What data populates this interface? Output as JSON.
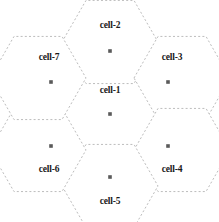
{
  "diagram": {
    "type": "hexagonal-cell-cluster",
    "background_color": "#ffffff",
    "border_color": "#bcbcbc",
    "dot_color": "#5a5a5a",
    "label_color": "#1a1a1a",
    "cells": [
      {
        "id": "cell-1",
        "label": "cell-1",
        "position": "center",
        "center_x": 110,
        "center_y": 114,
        "label_x": 110,
        "label_y": 91,
        "dot_x": 110,
        "dot_y": 114
      },
      {
        "id": "cell-2",
        "label": "cell-2",
        "position": "top",
        "center_x": 110,
        "center_y": 42,
        "label_x": 110,
        "label_y": 26,
        "dot_x": 110,
        "dot_y": 51
      },
      {
        "id": "cell-3",
        "label": "cell-3",
        "position": "upper-right",
        "center_x": 182,
        "center_y": 78,
        "label_x": 172,
        "label_y": 58,
        "dot_x": 168,
        "dot_y": 82
      },
      {
        "id": "cell-4",
        "label": "cell-4",
        "position": "lower-right",
        "center_x": 182,
        "center_y": 150,
        "label_x": 172,
        "label_y": 170,
        "dot_x": 168,
        "dot_y": 146
      },
      {
        "id": "cell-5",
        "label": "cell-5",
        "position": "bottom",
        "center_x": 110,
        "center_y": 186,
        "label_x": 110,
        "label_y": 202,
        "dot_x": 110,
        "dot_y": 177
      },
      {
        "id": "cell-6",
        "label": "cell-6",
        "position": "lower-left",
        "center_x": 38,
        "center_y": 150,
        "label_x": 49,
        "label_y": 170,
        "dot_x": 51,
        "dot_y": 146
      },
      {
        "id": "cell-7",
        "label": "cell-7",
        "position": "upper-left",
        "center_x": 38,
        "center_y": 78,
        "label_x": 49,
        "label_y": 58,
        "dot_x": 51,
        "dot_y": 82
      }
    ]
  }
}
